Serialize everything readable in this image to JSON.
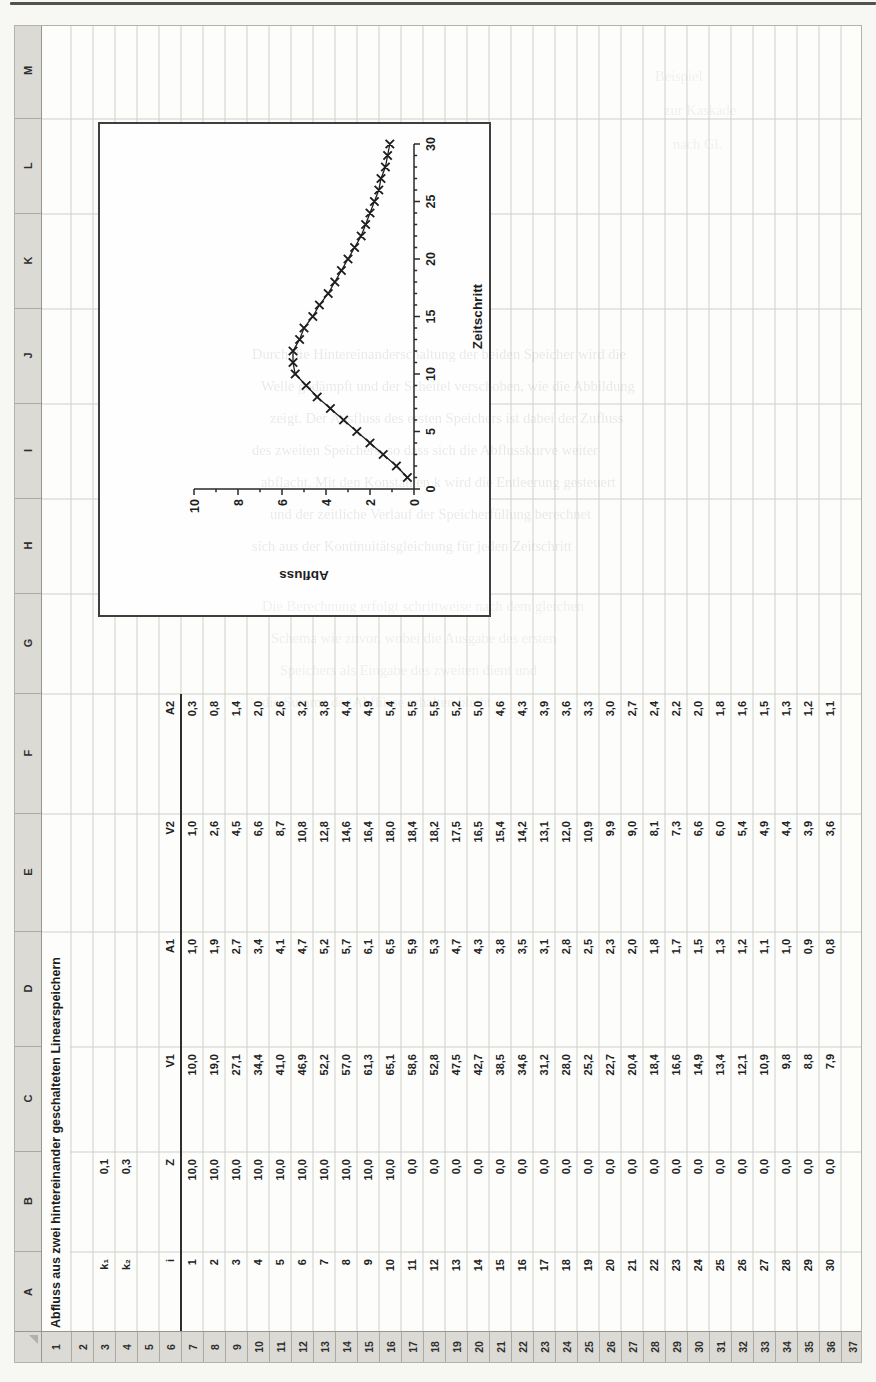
{
  "spreadsheet": {
    "title": "Abfluss aus zwei hintereinander geschalteten Linearspeichern",
    "column_letters": [
      "A",
      "B",
      "C",
      "D",
      "E",
      "F",
      "G",
      "H",
      "I",
      "J",
      "K",
      "L",
      "M"
    ],
    "row_numbers": [
      "1",
      "2",
      "3",
      "4",
      "5",
      "6",
      "7",
      "8",
      "9",
      "10",
      "11",
      "12",
      "13",
      "14",
      "15",
      "16",
      "17",
      "18",
      "19",
      "20",
      "21",
      "22",
      "23",
      "24",
      "25",
      "26",
      "27",
      "28",
      "29",
      "30",
      "31",
      "32",
      "33",
      "34",
      "35",
      "36",
      "37"
    ],
    "params": {
      "k1": {
        "label": "k₁",
        "value": "0,1"
      },
      "k2": {
        "label": "k₂",
        "value": "0,3"
      }
    },
    "table": {
      "headers": [
        "i",
        "Z",
        "V1",
        "A1",
        "V2",
        "A2"
      ],
      "rows": [
        [
          "1",
          "10,0",
          "10,0",
          "1,0",
          "1,0",
          "0,3"
        ],
        [
          "2",
          "10,0",
          "19,0",
          "1,9",
          "2,6",
          "0,8"
        ],
        [
          "3",
          "10,0",
          "27,1",
          "2,7",
          "4,5",
          "1,4"
        ],
        [
          "4",
          "10,0",
          "34,4",
          "3,4",
          "6,6",
          "2,0"
        ],
        [
          "5",
          "10,0",
          "41,0",
          "4,1",
          "8,7",
          "2,6"
        ],
        [
          "6",
          "10,0",
          "46,9",
          "4,7",
          "10,8",
          "3,2"
        ],
        [
          "7",
          "10,0",
          "52,2",
          "5,2",
          "12,8",
          "3,8"
        ],
        [
          "8",
          "10,0",
          "57,0",
          "5,7",
          "14,6",
          "4,4"
        ],
        [
          "9",
          "10,0",
          "61,3",
          "6,1",
          "16,4",
          "4,9"
        ],
        [
          "10",
          "10,0",
          "65,1",
          "6,5",
          "18,0",
          "5,4"
        ],
        [
          "11",
          "0,0",
          "58,6",
          "5,9",
          "18,4",
          "5,5"
        ],
        [
          "12",
          "0,0",
          "52,8",
          "5,3",
          "18,2",
          "5,5"
        ],
        [
          "13",
          "0,0",
          "47,5",
          "4,7",
          "17,5",
          "5,2"
        ],
        [
          "14",
          "0,0",
          "42,7",
          "4,3",
          "16,5",
          "5,0"
        ],
        [
          "15",
          "0,0",
          "38,5",
          "3,8",
          "15,4",
          "4,6"
        ],
        [
          "16",
          "0,0",
          "34,6",
          "3,5",
          "14,2",
          "4,3"
        ],
        [
          "17",
          "0,0",
          "31,2",
          "3,1",
          "13,1",
          "3,9"
        ],
        [
          "18",
          "0,0",
          "28,0",
          "2,8",
          "12,0",
          "3,6"
        ],
        [
          "19",
          "0,0",
          "25,2",
          "2,5",
          "10,9",
          "3,3"
        ],
        [
          "20",
          "0,0",
          "22,7",
          "2,3",
          "9,9",
          "3,0"
        ],
        [
          "21",
          "0,0",
          "20,4",
          "2,0",
          "9,0",
          "2,7"
        ],
        [
          "22",
          "0,0",
          "18,4",
          "1,8",
          "8,1",
          "2,4"
        ],
        [
          "23",
          "0,0",
          "16,6",
          "1,7",
          "7,3",
          "2,2"
        ],
        [
          "24",
          "0,0",
          "14,9",
          "1,5",
          "6,6",
          "2,0"
        ],
        [
          "25",
          "0,0",
          "13,4",
          "1,3",
          "6,0",
          "1,8"
        ],
        [
          "26",
          "0,0",
          "12,1",
          "1,2",
          "5,4",
          "1,6"
        ],
        [
          "27",
          "0,0",
          "10,9",
          "1,1",
          "4,9",
          "1,5"
        ],
        [
          "28",
          "0,0",
          "9,8",
          "1,0",
          "4,4",
          "1,3"
        ],
        [
          "29",
          "0,0",
          "8,8",
          "0,9",
          "3,9",
          "1,2"
        ],
        [
          "30",
          "0,0",
          "7,9",
          "0,8",
          "3,6",
          "1,1"
        ]
      ]
    }
  },
  "chart_data": {
    "type": "line",
    "marker": "x",
    "x": [
      1,
      2,
      3,
      4,
      5,
      6,
      7,
      8,
      9,
      10,
      11,
      12,
      13,
      14,
      15,
      16,
      17,
      18,
      19,
      20,
      21,
      22,
      23,
      24,
      25,
      26,
      27,
      28,
      29,
      30
    ],
    "series": [
      {
        "name": "A2",
        "values": [
          0.3,
          0.8,
          1.4,
          2.0,
          2.6,
          3.2,
          3.8,
          4.4,
          4.9,
          5.4,
          5.5,
          5.5,
          5.2,
          5.0,
          4.6,
          4.3,
          3.9,
          3.6,
          3.3,
          3.0,
          2.7,
          2.4,
          2.2,
          2.0,
          1.8,
          1.6,
          1.5,
          1.3,
          1.2,
          1.1
        ]
      }
    ],
    "title": "",
    "xlabel": "Zeitschritt",
    "ylabel": "Abfluss",
    "xlim": [
      0,
      30
    ],
    "ylim": [
      0,
      10
    ],
    "x_major_ticks": [
      0,
      5,
      10,
      15,
      20,
      25,
      30
    ],
    "y_major_ticks": [
      0,
      2,
      4,
      6,
      8,
      10
    ],
    "minor_tick_step": 1,
    "grid": false,
    "legend": false
  },
  "bleed_through": {
    "block1": [
      "Durch die Hintereinanderschaltung der beiden Speicher wird die",
      "Welle gedämpft und der Scheitel verschoben, wie die Abbildung",
      "zeigt. Der Ausfluss des ersten Speichers ist dabei der Zufluss",
      "des zweiten Speichers, so dass sich die Abflusskurve weiter",
      "abflacht. Mit den Konstanten k wird die Entleerung gesteuert",
      "und der zeitliche Verlauf der Speicherfüllung berechnet",
      "sich aus der Kontinuitätsgleichung für jeden Zeitschritt"
    ],
    "block2": [
      "Die Berechnung erfolgt schrittweise nach dem gleichen",
      "Schema wie zuvor, wobei die Ausgabe des ersten",
      "Speichers als Eingabe des zweiten dient und",
      "die Summe der Abflüsse erhalten bleibt"
    ],
    "block3": [
      "Beispiel",
      "zur Kaskade",
      "nach Gl."
    ]
  }
}
